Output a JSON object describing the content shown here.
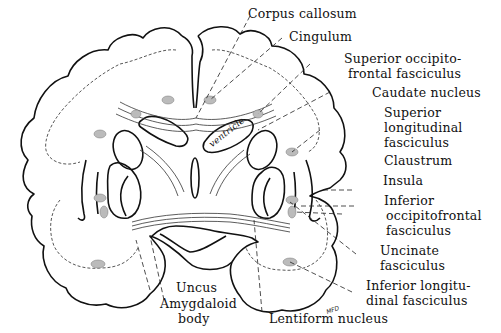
{
  "diagram": {
    "inner_label": "ventricle",
    "signature": "MFD",
    "labels": [
      {
        "id": "corpus-callosum",
        "text": "Corpus callosum"
      },
      {
        "id": "cingulum",
        "text": "Cingulum"
      },
      {
        "id": "superior-occipitofrontal",
        "line1": "Superior occipito-",
        "line2": "frontal fasciculus"
      },
      {
        "id": "caudate-nucleus",
        "text": "Caudate nucleus"
      },
      {
        "id": "superior-longitudinal",
        "line1": "Superior",
        "line2": "longitudinal",
        "line3": "fasciculus"
      },
      {
        "id": "claustrum",
        "text": "Claustrum"
      },
      {
        "id": "insula",
        "text": "Insula"
      },
      {
        "id": "inferior-occipitofrontal",
        "line1": "Inferior",
        "line2": "occipitofrontal",
        "line3": "fasciculus"
      },
      {
        "id": "uncinate",
        "line1": "Uncinate",
        "line2": "fasciculus"
      },
      {
        "id": "inferior-longitudinal",
        "line1": "Inferior longitu-",
        "line2": "dinal fasciculus"
      },
      {
        "id": "lentiform-nucleus",
        "text": "Lentiform nucleus"
      },
      {
        "id": "uncus",
        "text": "Uncus"
      },
      {
        "id": "amygdaloid-body",
        "line1": "Amygdaloid",
        "line2": "body"
      }
    ]
  }
}
